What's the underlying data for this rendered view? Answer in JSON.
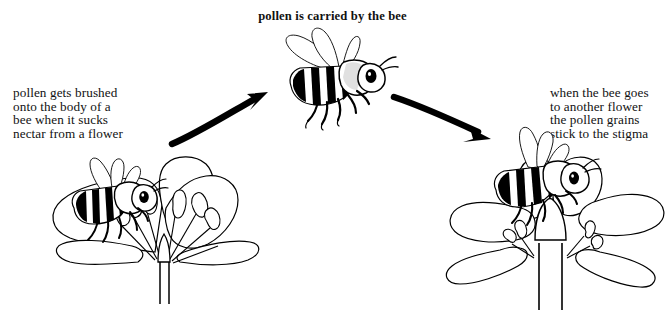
{
  "diagram": {
    "title": "pollen is carried by the bee",
    "background_color": "#ffffff",
    "ink_color": "#000000",
    "captions": {
      "left": "pollen gets brushed\nonto the body of a\nbee when it sucks\nnectar from a flower",
      "right": "when the bee goes\nto another flower\nthe pollen grains\nstick to the stigma"
    },
    "illustrations": {
      "flying_bee": "flying-bee-illustration",
      "left_flower": "flower-with-bee-collecting-nectar",
      "right_flower": "flower-with-bee-depositing-pollen"
    },
    "arrows": {
      "left": "curved-arrow-up-right",
      "right": "curved-arrow-down-right"
    }
  }
}
